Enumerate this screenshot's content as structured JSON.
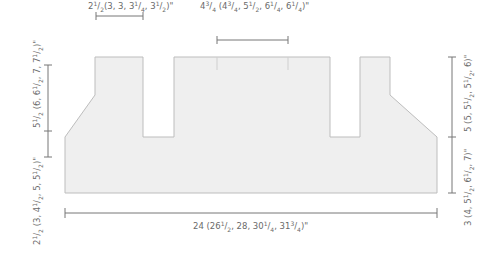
{
  "colors": {
    "shape_fill": "#efefef",
    "shape_stroke": "#bdbdbd",
    "dimension_line": "#777777",
    "label_text": "#6a6a6a"
  },
  "diagram": {
    "type": "knitting-schematic",
    "piece": "back-panel",
    "dimensions": {
      "notch_width": {
        "label": "2½ (3, 3, 3¼, 3½)\"",
        "parts": [
          {
            "t": "2"
          },
          {
            "s": "1"
          },
          {
            "t": "/"
          },
          {
            "b": "2"
          },
          {
            "t": "(3, 3, 3"
          },
          {
            "s": "1"
          },
          {
            "t": "/"
          },
          {
            "b": "4"
          },
          {
            "t": ", 3"
          },
          {
            "s": "1"
          },
          {
            "t": "/"
          },
          {
            "b": "2"
          },
          {
            "t": ")\""
          }
        ]
      },
      "center_width": {
        "label": "4¾ (4¾, 5½, 6¼, 6¼)\"",
        "parts": [
          {
            "t": "4"
          },
          {
            "s": "3"
          },
          {
            "t": "/"
          },
          {
            "b": "4"
          },
          {
            "t": " (4"
          },
          {
            "s": "3"
          },
          {
            "t": "/"
          },
          {
            "b": "4"
          },
          {
            "t": ", 5"
          },
          {
            "s": "1"
          },
          {
            "t": "/"
          },
          {
            "b": "2"
          },
          {
            "t": ", 6"
          },
          {
            "s": "1"
          },
          {
            "t": "/"
          },
          {
            "b": "4"
          },
          {
            "t": ", 6"
          },
          {
            "s": "1"
          },
          {
            "t": "/"
          },
          {
            "b": "4"
          },
          {
            "t": ")\""
          }
        ]
      },
      "left_lower_height": {
        "label": "2½ (3, 4½, 5, 5½)\"",
        "parts": [
          {
            "t": "2"
          },
          {
            "s": "1"
          },
          {
            "t": "/"
          },
          {
            "b": "2"
          },
          {
            "t": " (3, 4"
          },
          {
            "s": "1"
          },
          {
            "t": "/"
          },
          {
            "b": "2"
          },
          {
            "t": ", 5, 5"
          },
          {
            "s": "1"
          },
          {
            "t": "/"
          },
          {
            "b": "2"
          },
          {
            "t": ")\""
          }
        ]
      },
      "left_upper_height": {
        "label": "5½ (6, 6½, 7, 7½)\"",
        "parts": [
          {
            "t": "5"
          },
          {
            "s": "1"
          },
          {
            "t": "/"
          },
          {
            "b": "2"
          },
          {
            "t": " (6, 6"
          },
          {
            "s": "1"
          },
          {
            "t": "/"
          },
          {
            "b": "2"
          },
          {
            "t": ", 7, 7"
          },
          {
            "s": "1"
          },
          {
            "t": "/"
          },
          {
            "b": "2"
          },
          {
            "t": ")\""
          }
        ]
      },
      "right_lower_height": {
        "label": "3 (4, 5½, 6½, 7)\"",
        "parts": [
          {
            "t": "3 (4, 5"
          },
          {
            "s": "1"
          },
          {
            "t": "/"
          },
          {
            "b": "2"
          },
          {
            "t": ", 6"
          },
          {
            "s": "1"
          },
          {
            "t": "/"
          },
          {
            "b": "2"
          },
          {
            "t": ", 7)\""
          }
        ]
      },
      "right_upper_height": {
        "label": "5 (5, 5½, 5½, 6)\"",
        "parts": [
          {
            "t": "5 (5, 5"
          },
          {
            "s": "1"
          },
          {
            "t": "/"
          },
          {
            "b": "2"
          },
          {
            "t": ", 5"
          },
          {
            "s": "1"
          },
          {
            "t": "/"
          },
          {
            "b": "2"
          },
          {
            "t": ", 6)\""
          }
        ]
      },
      "total_width": {
        "label": "24 (26½, 28, 30¼, 31¾)\"",
        "parts": [
          {
            "t": "24 (26"
          },
          {
            "s": "1"
          },
          {
            "t": "/"
          },
          {
            "b": "2"
          },
          {
            "t": ", 28, 30"
          },
          {
            "s": "1"
          },
          {
            "t": "/"
          },
          {
            "b": "4"
          },
          {
            "t": ", 31"
          },
          {
            "s": "3"
          },
          {
            "t": "/"
          },
          {
            "b": "4"
          },
          {
            "t": ")\""
          }
        ]
      }
    }
  }
}
